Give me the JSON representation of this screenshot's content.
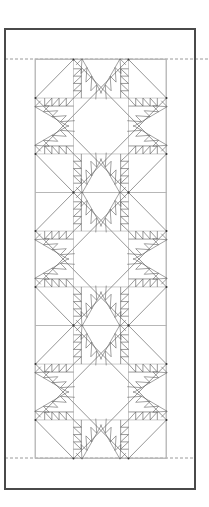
{
  "diagram": {
    "title": "",
    "type": "quilt-pattern",
    "pattern_name": "Feathered Star table runner",
    "canvas": {
      "width": 209,
      "height": 507,
      "background": "#ffffff"
    },
    "frame": {
      "x": 5,
      "y": 29,
      "width": 190,
      "height": 460,
      "stroke": "#4a4a4a",
      "stroke_width": 2
    },
    "fold_lines": [
      {
        "y": 59,
        "x1": 5,
        "x2": 209,
        "stroke": "#9a9a9a",
        "dash": "3,2"
      },
      {
        "y": 458,
        "x1": 5,
        "x2": 195,
        "stroke": "#9a9a9a",
        "dash": "3,2"
      }
    ],
    "inner_border": {
      "x": 35,
      "y": 59,
      "width": 131,
      "height": 399,
      "stroke": "#bdbdbd"
    },
    "blocks": [
      {
        "x": 35,
        "y": 59,
        "size": 131,
        "height": 133
      },
      {
        "x": 35,
        "y": 192,
        "size": 131,
        "height": 133
      },
      {
        "x": 35,
        "y": 325,
        "size": 131,
        "height": 133
      }
    ],
    "block_geometry": {
      "grid_lines_frac": [
        0.29,
        0.71
      ],
      "feathers_per_edge": 4,
      "line_color": "#8a8a8a",
      "feather_color": "#555555",
      "point_color": "#333333"
    },
    "colors": {
      "frame": "#4a4a4a",
      "grid": "#b5b5b5",
      "star": "#8a8a8a",
      "feather": "#555555"
    }
  }
}
